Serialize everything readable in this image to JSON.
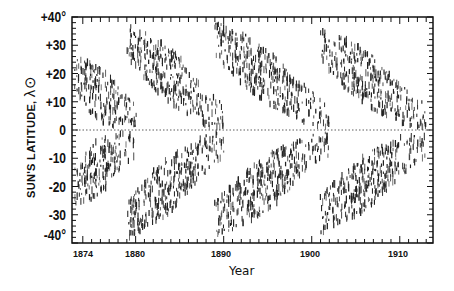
{
  "chart_data": {
    "type": "scatter",
    "title": "",
    "xlabel": "Year",
    "ylabel": "SUN'S LATITUDE, λ⊙",
    "xlim": [
      1873,
      1914
    ],
    "ylim": [
      -40,
      40
    ],
    "x_ticks": [
      "1874",
      "1880",
      "1890",
      "1900",
      "1910"
    ],
    "y_ticks": [
      "+40°",
      "+30",
      "+20",
      "+10",
      "0",
      "-10",
      "-20",
      "-30",
      "-40°"
    ],
    "grid": false,
    "equator_line": "dotted at 0",
    "cycles": [
      {
        "start_year": 1873,
        "end_year": 1880,
        "lat_start": 20,
        "lat_end": 3,
        "note": "end of cycle"
      },
      {
        "start_year": 1879,
        "end_year": 1890,
        "lat_start": 32,
        "lat_end": 3
      },
      {
        "start_year": 1889,
        "end_year": 1902,
        "lat_start": 32,
        "lat_end": 3
      },
      {
        "start_year": 1901,
        "end_year": 1913,
        "lat_start": 30,
        "lat_end": 3
      }
    ]
  },
  "axis": {
    "y_title": "SUN'S LATITUDE,",
    "y_symbol": "λ⊙",
    "x_title": "Year"
  }
}
